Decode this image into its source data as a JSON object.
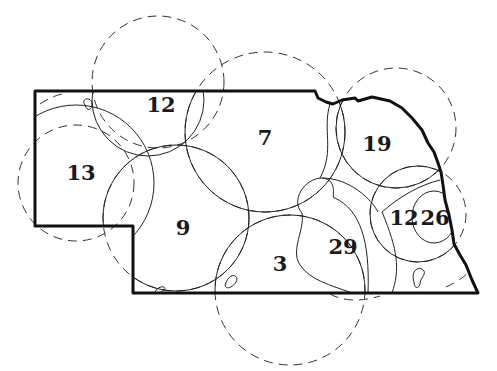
{
  "diagram": {
    "colors": {
      "outline": "#111111",
      "circle": "#222222",
      "background": "#ffffff"
    },
    "regions": [
      {
        "id": "r13",
        "label": "13",
        "x": 81,
        "y": 172
      },
      {
        "id": "r12w",
        "label": "12",
        "x": 161,
        "y": 104
      },
      {
        "id": "r7",
        "label": "7",
        "x": 265,
        "y": 137
      },
      {
        "id": "r19",
        "label": "19",
        "x": 377,
        "y": 143
      },
      {
        "id": "r9",
        "label": "9",
        "x": 183,
        "y": 227
      },
      {
        "id": "r3",
        "label": "3",
        "x": 280,
        "y": 263
      },
      {
        "id": "r29",
        "label": "29",
        "x": 343,
        "y": 246
      },
      {
        "id": "r12e",
        "label": "12",
        "x": 404,
        "y": 217
      },
      {
        "id": "r26",
        "label": "26",
        "x": 435,
        "y": 217
      }
    ]
  }
}
